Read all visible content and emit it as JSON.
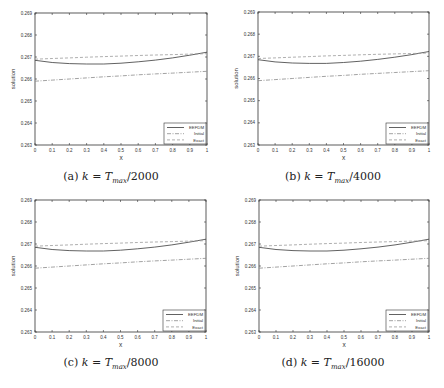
{
  "chart_data": [
    {
      "type": "line",
      "panel": "a",
      "caption": "(a) k = T_max/2000",
      "caption_prefix": "(a)",
      "caption_denominator": "2000",
      "xlabel": "x",
      "ylabel": "solution",
      "xlim": [
        0,
        1
      ],
      "ylim": [
        0.263,
        0.269
      ],
      "xticks": [
        "0",
        "0.1",
        "0.2",
        "0.3",
        "0.4",
        "0.5",
        "0.6",
        "0.7",
        "0.8",
        "0.9",
        "1"
      ],
      "yticks": [
        "0.263",
        "0.264",
        "0.265",
        "0.266",
        "0.267",
        "0.268",
        "0.269"
      ],
      "legend": [
        "EEFDM",
        "Initial",
        "Exact"
      ],
      "legend_position": "lower right",
      "x": [
        0,
        0.1,
        0.2,
        0.3,
        0.4,
        0.5,
        0.6,
        0.7,
        0.8,
        0.9,
        1
      ],
      "series": [
        {
          "name": "EEFDM",
          "style": "solid",
          "values": [
            0.26685,
            0.26675,
            0.2667,
            0.26668,
            0.26668,
            0.26672,
            0.26678,
            0.26686,
            0.26696,
            0.26708,
            0.26722
          ]
        },
        {
          "name": "Initial",
          "style": "dashdot",
          "values": [
            0.2659,
            0.26595,
            0.266,
            0.26605,
            0.2661,
            0.26614,
            0.26619,
            0.26623,
            0.26627,
            0.26631,
            0.26635
          ]
        },
        {
          "name": "Exact",
          "style": "dashed",
          "values": [
            0.2669,
            0.26693,
            0.26696,
            0.26699,
            0.26702,
            0.26704,
            0.26707,
            0.26709,
            0.26711,
            0.26713,
            0.26715
          ]
        }
      ]
    },
    {
      "type": "line",
      "panel": "b",
      "caption": "(b) k = T_max/4000",
      "caption_prefix": "(b)",
      "caption_denominator": "4000",
      "xlabel": "x",
      "ylabel": "solution",
      "xlim": [
        0,
        1
      ],
      "ylim": [
        0.263,
        0.269
      ],
      "xticks": [
        "0",
        "0.1",
        "0.2",
        "0.3",
        "0.4",
        "0.5",
        "0.6",
        "0.7",
        "0.8",
        "0.9",
        "1"
      ],
      "yticks": [
        "0.263",
        "0.264",
        "0.265",
        "0.266",
        "0.267",
        "0.268",
        "0.269"
      ],
      "legend": [
        "EEFDM",
        "Initial",
        "Exact"
      ],
      "legend_position": "lower right",
      "x": [
        0,
        0.1,
        0.2,
        0.3,
        0.4,
        0.5,
        0.6,
        0.7,
        0.8,
        0.9,
        1
      ],
      "series": [
        {
          "name": "EEFDM",
          "style": "solid",
          "values": [
            0.26685,
            0.26675,
            0.2667,
            0.26668,
            0.26668,
            0.26672,
            0.26678,
            0.26686,
            0.26696,
            0.26708,
            0.26722
          ]
        },
        {
          "name": "Initial",
          "style": "dashdot",
          "values": [
            0.2659,
            0.26595,
            0.266,
            0.26605,
            0.2661,
            0.26614,
            0.26619,
            0.26623,
            0.26627,
            0.26631,
            0.26635
          ]
        },
        {
          "name": "Exact",
          "style": "dashed",
          "values": [
            0.2669,
            0.26693,
            0.26696,
            0.26699,
            0.26702,
            0.26704,
            0.26707,
            0.26709,
            0.26711,
            0.26713,
            0.26715
          ]
        }
      ]
    },
    {
      "type": "line",
      "panel": "c",
      "caption": "(c) k = T_max/8000",
      "caption_prefix": "(c)",
      "caption_denominator": "8000",
      "xlabel": "x",
      "ylabel": "solution",
      "xlim": [
        0,
        1
      ],
      "ylim": [
        0.263,
        0.269
      ],
      "xticks": [
        "0",
        "0.1",
        "0.2",
        "0.3",
        "0.4",
        "0.5",
        "0.6",
        "0.7",
        "0.8",
        "0.9",
        "1"
      ],
      "yticks": [
        "0.263",
        "0.264",
        "0.265",
        "0.266",
        "0.267",
        "0.268",
        "0.269"
      ],
      "legend": [
        "EEFDM",
        "Initial",
        "Exact"
      ],
      "legend_position": "lower right",
      "x": [
        0,
        0.1,
        0.2,
        0.3,
        0.4,
        0.5,
        0.6,
        0.7,
        0.8,
        0.9,
        1
      ],
      "series": [
        {
          "name": "EEFDM",
          "style": "solid",
          "values": [
            0.26685,
            0.26675,
            0.2667,
            0.26668,
            0.26668,
            0.26672,
            0.26678,
            0.26686,
            0.26696,
            0.26708,
            0.26722
          ]
        },
        {
          "name": "Initial",
          "style": "dashdot",
          "values": [
            0.2659,
            0.26595,
            0.266,
            0.26605,
            0.2661,
            0.26614,
            0.26619,
            0.26623,
            0.26627,
            0.26631,
            0.26635
          ]
        },
        {
          "name": "Exact",
          "style": "dashed",
          "values": [
            0.2669,
            0.26693,
            0.26696,
            0.26699,
            0.26702,
            0.26704,
            0.26707,
            0.26709,
            0.26711,
            0.26713,
            0.26715
          ]
        }
      ]
    },
    {
      "type": "line",
      "panel": "d",
      "caption": "(d) k = T_max/16000",
      "caption_prefix": "(d)",
      "caption_denominator": "16000",
      "xlabel": "x",
      "ylabel": "solution",
      "xlim": [
        0,
        1
      ],
      "ylim": [
        0.263,
        0.269
      ],
      "xticks": [
        "0",
        "0.1",
        "0.2",
        "0.3",
        "0.4",
        "0.5",
        "0.6",
        "0.7",
        "0.8",
        "0.9",
        "1"
      ],
      "yticks": [
        "0.263",
        "0.264",
        "0.265",
        "0.266",
        "0.267",
        "0.268",
        "0.269"
      ],
      "legend": [
        "EEFDM",
        "Initial",
        "Exact"
      ],
      "legend_position": "lower right",
      "x": [
        0,
        0.1,
        0.2,
        0.3,
        0.4,
        0.5,
        0.6,
        0.7,
        0.8,
        0.9,
        1
      ],
      "series": [
        {
          "name": "EEFDM",
          "style": "solid",
          "values": [
            0.26685,
            0.26675,
            0.2667,
            0.26668,
            0.26668,
            0.26672,
            0.26678,
            0.26686,
            0.26696,
            0.26708,
            0.26722
          ]
        },
        {
          "name": "Initial",
          "style": "dashdot",
          "values": [
            0.2659,
            0.26595,
            0.266,
            0.26605,
            0.2661,
            0.26614,
            0.26619,
            0.26623,
            0.26627,
            0.26631,
            0.26635
          ]
        },
        {
          "name": "Exact",
          "style": "dashed",
          "values": [
            0.2669,
            0.26693,
            0.26696,
            0.26699,
            0.26702,
            0.26704,
            0.26707,
            0.26709,
            0.26711,
            0.26713,
            0.26715
          ]
        }
      ]
    }
  ],
  "colors": {
    "axes": "#333333",
    "eefdm": "#3a3a3a",
    "initial": "#8a8a8a",
    "exact": "#9a9a9a",
    "text": "#333333"
  }
}
